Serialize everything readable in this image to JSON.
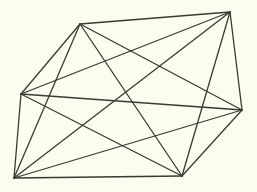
{
  "diagram": {
    "type": "complete-graph",
    "background": "#fcfcf0",
    "stroke": "#3a3a32",
    "stroke_width": 1.3,
    "vertices": [
      {
        "id": "A",
        "x": 80,
        "y": 24
      },
      {
        "id": "B",
        "x": 230,
        "y": 12
      },
      {
        "id": "C",
        "x": 242,
        "y": 110
      },
      {
        "id": "D",
        "x": 182,
        "y": 176
      },
      {
        "id": "E",
        "x": 14,
        "y": 178
      },
      {
        "id": "F",
        "x": 21,
        "y": 94
      }
    ]
  }
}
